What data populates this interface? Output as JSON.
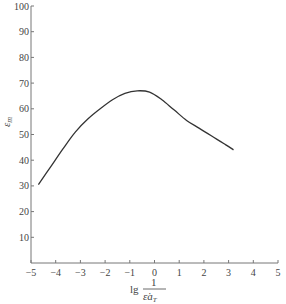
{
  "chart_data": {
    "type": "line",
    "title": "",
    "xlabel": "lg 1/(ε̇ a_T)",
    "xlabel_parts": {
      "prefix": "lg",
      "numerator": "1",
      "denominator": "ε̇a",
      "subscript": "T"
    },
    "ylabel": "ε_m",
    "ylabel_parts": {
      "main": "ε",
      "subscript": "m"
    },
    "xlim": [
      -5,
      5
    ],
    "ylim": [
      0,
      100
    ],
    "xticks": [
      -5,
      -4,
      -3,
      -2,
      -1,
      0,
      1,
      2,
      3,
      4,
      5
    ],
    "xtick_labels": [
      "−5",
      "−4",
      "−3",
      "−2",
      "−1",
      "0",
      "1",
      "2",
      "3",
      "4",
      "5"
    ],
    "yticks": [
      10,
      20,
      30,
      40,
      50,
      60,
      70,
      80,
      90,
      100
    ],
    "ytick_labels": [
      "10",
      "20",
      "30",
      "40",
      "50",
      "60",
      "70",
      "80",
      "90",
      "100"
    ],
    "grid": false,
    "legend": null,
    "series": [
      {
        "name": "ε_m",
        "x": [
          -4.7,
          -4.2,
          -3.7,
          -3.2,
          -2.7,
          -2.2,
          -1.7,
          -1.2,
          -0.7,
          -0.2,
          0.3,
          0.8,
          1.3,
          1.8,
          2.3,
          2.8,
          3.2
        ],
        "y": [
          30.5,
          37.5,
          44.5,
          51,
          56,
          60,
          63.5,
          66,
          67,
          66.5,
          63.5,
          59.5,
          55.5,
          52.5,
          49.5,
          46.5,
          44
        ]
      }
    ],
    "colors": {
      "line": "#333333",
      "axis": "#777777"
    }
  }
}
